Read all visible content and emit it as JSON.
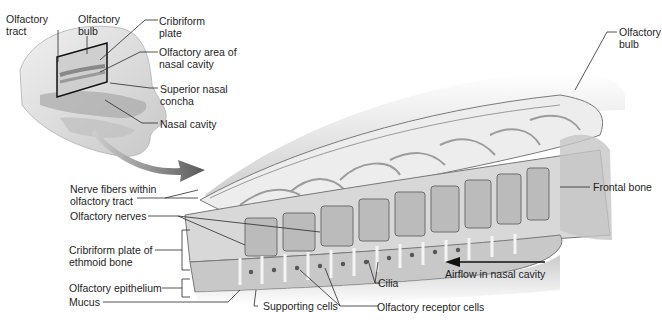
{
  "diagram": {
    "inset_labels": {
      "olfactory_tract": [
        "Olfactory",
        "tract"
      ],
      "olfactory_bulb": [
        "Olfactory",
        "bulb"
      ],
      "cribriform_plate": [
        "Cribriform",
        "plate"
      ],
      "olfactory_area": [
        "Olfactory area of",
        "nasal cavity"
      ],
      "superior_nasal_concha": [
        "Superior nasal",
        "concha"
      ],
      "nasal_cavity": "Nasal cavity"
    },
    "main_labels": {
      "olfactory_bulb_right": [
        "Olfactory",
        "bulb"
      ],
      "frontal_bone": "Frontal bone",
      "nerve_fibers": [
        "Nerve fibers within",
        "olfactory tract"
      ],
      "olfactory_nerves": "Olfactory nerves",
      "cribriform_plate_ethmoid": [
        "Cribriform plate of",
        "ethmoid bone"
      ],
      "olfactory_epithelium": "Olfactory epithelium",
      "mucus": "Mucus",
      "supporting_cells": "Supporting cells",
      "olfactory_receptor_cells": "Olfactory receptor cells",
      "cilia": "Cilia",
      "airflow": "Airflow in nasal cavity"
    },
    "colors": {
      "line": "#2a2a2a",
      "tissue_light": "#e6e6e6",
      "tissue_mid": "#bdbdbd",
      "tissue_dark": "#8a8a8a",
      "arrow": "#707070"
    }
  }
}
